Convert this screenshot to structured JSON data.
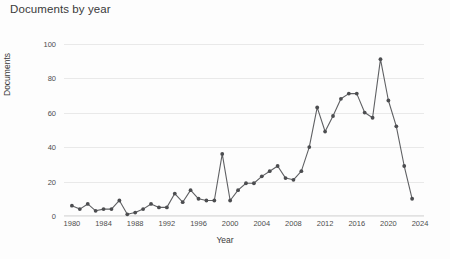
{
  "chart_data": {
    "type": "line",
    "title": "Documents by year",
    "xlabel": "Year",
    "ylabel": "Documents",
    "grid": true,
    "legend": "none",
    "xlim": [
      1979,
      2024.5
    ],
    "ylim": [
      0,
      105
    ],
    "yticks": [
      0,
      20,
      40,
      60,
      80,
      100
    ],
    "xticks": [
      1980,
      1984,
      1988,
      1992,
      1996,
      2000,
      2004,
      2008,
      2012,
      2016,
      2020,
      2024
    ],
    "x": [
      1980,
      1981,
      1982,
      1983,
      1984,
      1985,
      1986,
      1987,
      1988,
      1989,
      1990,
      1991,
      1992,
      1993,
      1994,
      1995,
      1996,
      1997,
      1998,
      1999,
      2000,
      2001,
      2002,
      2003,
      2004,
      2005,
      2006,
      2007,
      2008,
      2009,
      2010,
      2011,
      2012,
      2013,
      2014,
      2015,
      2016,
      2017,
      2018,
      2019,
      2020,
      2021,
      2022,
      2023
    ],
    "values": [
      6,
      4,
      7,
      3,
      4,
      4,
      9,
      1,
      2,
      4,
      7,
      5,
      5,
      13,
      8,
      15,
      10,
      9,
      9,
      36,
      9,
      15,
      19,
      19,
      23,
      26,
      29,
      22,
      21,
      26,
      40,
      63,
      49,
      58,
      68,
      71,
      71,
      60,
      57,
      91,
      67,
      52,
      29,
      10
    ],
    "series": [
      {
        "name": "Documents",
        "values": [
          6,
          4,
          7,
          3,
          4,
          4,
          9,
          1,
          2,
          4,
          7,
          5,
          5,
          13,
          8,
          15,
          10,
          9,
          9,
          36,
          9,
          15,
          19,
          19,
          23,
          26,
          29,
          22,
          21,
          26,
          40,
          63,
          49,
          58,
          68,
          71,
          71,
          60,
          57,
          91,
          67,
          52,
          29,
          10
        ]
      }
    ],
    "marker": "circle",
    "line_color": "#5f6063",
    "marker_color": "#4c4d50",
    "grid_color": "#e9e9e9",
    "background": "#fdfdfd"
  },
  "chart": {
    "title": "Documents by year",
    "xlabel": "Year",
    "ylabel": "Documents"
  }
}
